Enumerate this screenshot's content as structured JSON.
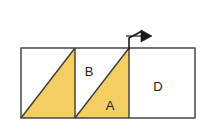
{
  "figure": {
    "background_color": "#ffffff",
    "stroke_color": "#3b3b3b",
    "fill_yellow": "#f2ce63",
    "fill_white": "#ffffff",
    "label_color": "#231f20",
    "outer_rect": {
      "x": 21,
      "y": 48,
      "width": 174,
      "height": 70
    },
    "dividers": [
      {
        "name": "divider-1",
        "x": 75
      },
      {
        "name": "divider-2",
        "x": 129
      }
    ],
    "panels": [
      {
        "id": "panel-left",
        "label": "",
        "x": 21,
        "width": 54,
        "shaded_triangle": "bottom-right",
        "fill": "#f2ce63"
      },
      {
        "id": "panel-middle",
        "label_upper": "B",
        "label_lower": "A",
        "x": 75,
        "width": 54,
        "shaded_triangle": "bottom-right",
        "fill_upper": "#ffffff",
        "fill_lower": "#f2ce63"
      },
      {
        "id": "panel-right",
        "label": "D",
        "x": 129,
        "width": 66,
        "shaded_triangle": "none",
        "fill": "#ffffff"
      }
    ],
    "labels": [
      {
        "name": "label-B",
        "text": "B",
        "x": 89,
        "y": 73
      },
      {
        "name": "label-A",
        "text": "A",
        "x": 110,
        "y": 107
      },
      {
        "name": "label-D",
        "text": "D",
        "x": 158,
        "y": 88
      }
    ],
    "arrow": {
      "name": "force-arrow",
      "label": "",
      "stem_start": {
        "x": 129,
        "y": 48
      },
      "stem_corner": {
        "x": 129,
        "y": 38
      },
      "tip": {
        "x": 150,
        "y": 35
      },
      "direction": "right",
      "color": "#1a1a1a"
    }
  }
}
